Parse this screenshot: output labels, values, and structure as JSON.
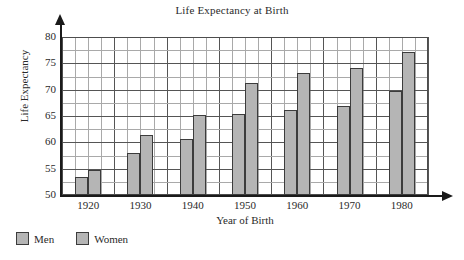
{
  "chart_data": {
    "type": "bar",
    "title": "Life Expectancy at Birth",
    "xlabel": "Year of Birth",
    "ylabel": "Life Expectancy",
    "categories": [
      "1920",
      "1930",
      "1940",
      "1950",
      "1960",
      "1970",
      "1980"
    ],
    "series": [
      {
        "name": "Men",
        "values": [
          53.5,
          58.0,
          60.6,
          65.3,
          66.1,
          66.9,
          69.8
        ]
      },
      {
        "name": "Women",
        "values": [
          54.8,
          61.4,
          65.2,
          71.3,
          73.1,
          74.1,
          77.2
        ]
      }
    ],
    "ylim": [
      50,
      80
    ],
    "ytick_labels": [
      "50",
      "55",
      "60",
      "65",
      "70",
      "75",
      "80"
    ],
    "ytick_values": [
      50,
      55,
      60,
      65,
      70,
      75,
      80
    ],
    "y_minor_step": 2.5,
    "grid": true,
    "legend_position": "bottom-left",
    "bar_color": "#b5b5b5",
    "bar_outline_color": "#3c3c3c",
    "grid_color": "#a9a9a9",
    "axis_color": "#1a1a1a"
  },
  "legend": {
    "items": [
      {
        "label": "Men"
      },
      {
        "label": "Women"
      }
    ]
  }
}
